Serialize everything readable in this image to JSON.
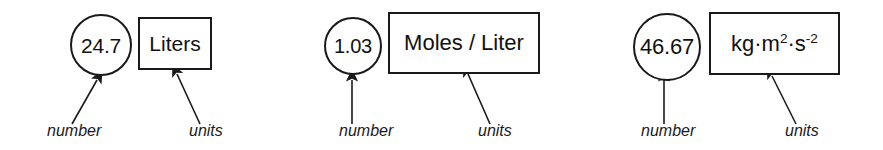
{
  "figure": {
    "background_color": "#ffffff",
    "stroke_color": "#1a1a1a",
    "text_color": "#111111"
  },
  "groups": [
    {
      "id": "group-liters",
      "number": "24.7",
      "units": "Liters",
      "units_is_plain": true,
      "number_label": "number",
      "units_label": "units"
    },
    {
      "id": "group-molarity",
      "number": "1.03",
      "units": "Moles / Liter",
      "units_is_plain": true,
      "number_label": "number",
      "units_label": "units"
    },
    {
      "id": "group-energy",
      "number": "46.67",
      "units": "kg·m2·s-2",
      "units_is_plain": false,
      "units_parts": {
        "base1": "kg·m",
        "exp1": "2",
        "base2": "·s",
        "exp2": "-2"
      },
      "number_label": "number",
      "units_label": "units"
    }
  ]
}
